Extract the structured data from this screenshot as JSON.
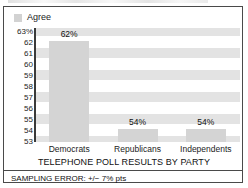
{
  "legend": {
    "swatch_name": "legend-swatch-agree",
    "label": "Agree",
    "color": "#d2d2d2"
  },
  "footnote": "SAMPLING ERROR: +/− 7% pts",
  "chart_data": {
    "type": "bar",
    "title": "TELEPHONE POLL RESULTS BY PARTY",
    "xlabel": "",
    "ylabel": "",
    "categories": [
      "Democrats",
      "Republicans",
      "Independents"
    ],
    "values": [
      62,
      54,
      54
    ],
    "value_labels": [
      "62%",
      "54%",
      "54%"
    ],
    "series": [
      {
        "name": "Agree",
        "values": [
          62,
          54,
          54
        ],
        "color": "#d4d4d4"
      }
    ],
    "ylim": [
      53,
      63
    ],
    "ytick_labels": [
      "63%",
      "62",
      "61",
      "60",
      "59",
      "58",
      "57",
      "56",
      "55",
      "54",
      "53"
    ],
    "ytick_values": [
      63,
      62,
      61,
      60,
      59,
      58,
      57,
      56,
      55,
      54,
      53
    ],
    "grid": false,
    "banding": true,
    "band_color": "#e3e3e3",
    "legend_position": "top-left",
    "bar_color": "#d4d4d4",
    "axis_color": "#3a3a3a"
  }
}
